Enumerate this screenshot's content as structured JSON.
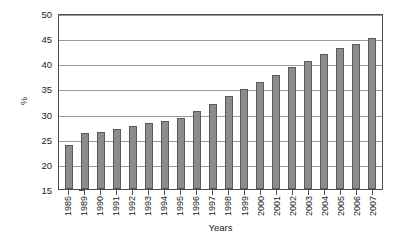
{
  "chart_data": {
    "type": "bar",
    "title": "",
    "xlabel": "Years",
    "ylabel": "%",
    "ylim": [
      15,
      50
    ],
    "ytick_step": 5,
    "yticks": [
      50,
      45,
      40,
      35,
      30,
      25,
      20,
      15
    ],
    "grid": true,
    "legend": null,
    "categories": [
      "1985",
      "1989",
      "1990",
      "1991",
      "1992",
      "1993",
      "1994",
      "1995",
      "1996",
      "1997",
      "1998",
      "1999",
      "2000",
      "2001",
      "2002",
      "2003",
      "2004",
      "2005",
      "2006",
      "2007"
    ],
    "values": [
      23.7,
      26.1,
      26.4,
      26.9,
      27.5,
      28.1,
      28.6,
      29.2,
      30.6,
      31.9,
      33.5,
      34.8,
      36.3,
      37.7,
      39.2,
      40.5,
      41.8,
      43.0,
      43.9,
      45.0
    ],
    "bar_color": "#8c8c8c",
    "bar_border_color": "#5a5a5a",
    "axis_color": "#4d4d4d",
    "grid_color": "#9a9a9a",
    "background_color": "#ffffff"
  }
}
